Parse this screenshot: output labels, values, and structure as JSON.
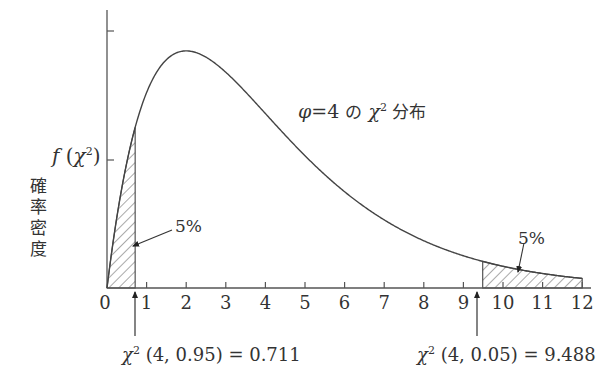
{
  "chart_data": {
    "type": "line",
    "xlabel": "",
    "ylabel": "確率密度 f(χ²)",
    "xlim": [
      0,
      12
    ],
    "ylim": [
      0,
      0.2
    ],
    "x_ticks": [
      0,
      1,
      2,
      3,
      4,
      5,
      6,
      7,
      8,
      9,
      10,
      11,
      12
    ],
    "y_ticks": [
      0.1,
      0.2
    ],
    "y_tick_labels_shown": false,
    "grid": false,
    "series": [
      {
        "name": "chi-square pdf, df=4",
        "formula": "f(x) = x * exp(-x/2) / 4",
        "x": [
          0,
          0.5,
          0.711,
          1,
          1.5,
          2,
          2.5,
          3,
          4,
          5,
          6,
          7,
          8,
          9,
          9.488,
          10,
          11,
          12
        ],
        "y": [
          0,
          0.0974,
          0.1244,
          0.1516,
          0.1771,
          0.1839,
          0.1791,
          0.1673,
          0.1353,
          0.1026,
          0.0747,
          0.0528,
          0.0366,
          0.025,
          0.0207,
          0.0168,
          0.0112,
          0.0074
        ]
      }
    ],
    "shaded_regions": [
      {
        "from": 0,
        "to": 0.711,
        "area_label": "5%",
        "pattern": "hatched"
      },
      {
        "from": 9.488,
        "to": 12,
        "area_label": "5%",
        "pattern": "hatched"
      }
    ],
    "annotations": [
      {
        "text": "χ² (4,  0.95) = 0.711",
        "x": 0.711,
        "value": 0.711
      },
      {
        "text": "χ² (4,  0.05) = 9.488",
        "x": 9.488,
        "value": 9.488
      }
    ]
  },
  "labels": {
    "ylabel_cjk": [
      "確",
      "率",
      "密",
      "度"
    ],
    "ylabel_fn_f": "f",
    "ylabel_fn_open": "(",
    "ylabel_fn_chi": "χ",
    "ylabel_fn_sup": "2",
    "ylabel_fn_close": ")",
    "title_phi": "φ",
    "title_eq": "=4 ",
    "title_no": "の",
    "title_chi": "χ",
    "title_sup": "2",
    "title_dist": " 分布",
    "pct_left": "5%",
    "pct_right": "5%",
    "crit_left_chi": "χ",
    "crit_left_sup": "2",
    "crit_left_rest": " (4,  0.95) = 0.711",
    "crit_right_chi": "χ",
    "crit_right_sup": "2",
    "crit_right_rest": " (4,  0.05) = 9.488",
    "ticks": [
      "0",
      "1",
      "2",
      "3",
      "4",
      "5",
      "6",
      "7",
      "8",
      "9",
      "10",
      "11",
      "12"
    ]
  },
  "colors": {
    "line": "#444444",
    "text": "#333333",
    "background": "#ffffff"
  }
}
